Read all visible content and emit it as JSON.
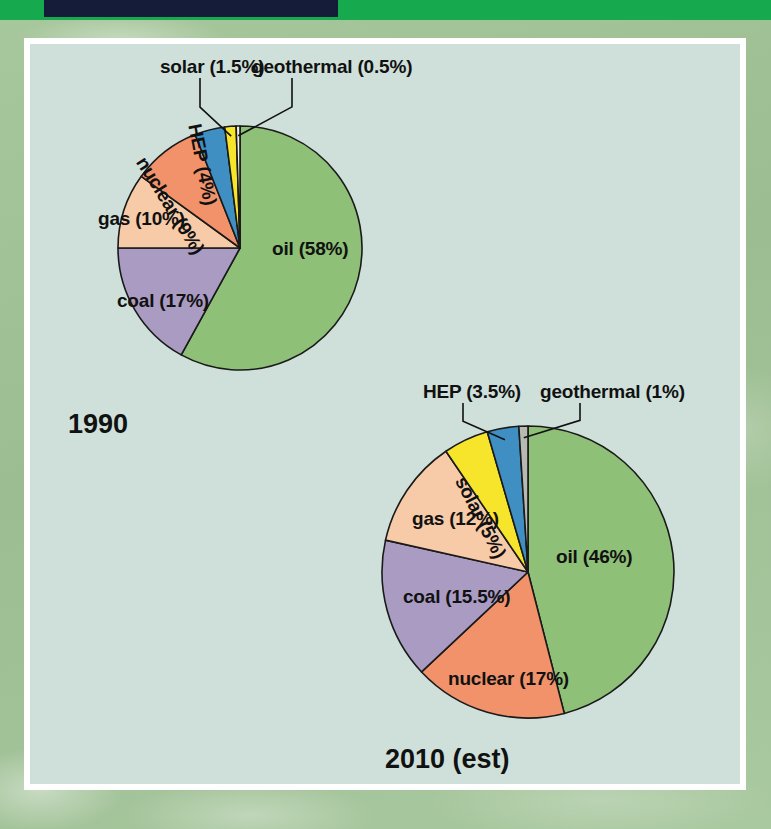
{
  "page": {
    "background_color": "#a2c398",
    "panel_color": "#cfe0da",
    "panel_border_color": "#ffffff",
    "header_bar_color": "#16a94e",
    "header_block_color": "#141c3a"
  },
  "chart_data": [
    {
      "type": "pie",
      "title": "1990",
      "total": 100,
      "start_angle_deg": 0,
      "direction": "clockwise",
      "center": {
        "x": 240,
        "y": 248
      },
      "radius": 122,
      "labels": [
        "oil",
        "coal",
        "gas",
        "nuclear",
        "HEP",
        "solar",
        "geothermal"
      ],
      "values": [
        58,
        17,
        10,
        9,
        4,
        1.5,
        0.5
      ],
      "slices": [
        {
          "label": "oil (58%)",
          "name": "oil",
          "value": 58,
          "color": "#8ec077",
          "label_style": "inside",
          "label_pos": {
            "x": 272,
            "y": 238
          }
        },
        {
          "label": "coal (17%)",
          "name": "coal",
          "value": 17,
          "color": "#a99bc2",
          "label_style": "inside",
          "label_pos": {
            "x": 117,
            "y": 290
          }
        },
        {
          "label": "gas (10%)",
          "name": "gas",
          "value": 10,
          "color": "#f7cba7",
          "label_style": "inside",
          "label_pos": {
            "x": 98,
            "y": 208
          }
        },
        {
          "label": "nuclear (9%)",
          "name": "nuclear",
          "value": 9,
          "color": "#f2926a",
          "label_style": "radial",
          "label_pos": {
            "x": 150,
            "y": 153
          },
          "rotation": 58
        },
        {
          "label": "HEP (4%)",
          "name": "HEP",
          "value": 4,
          "color": "#3f8fc3",
          "label_style": "radial",
          "label_pos": {
            "x": 205,
            "y": 122
          },
          "rotation": 79
        },
        {
          "label": "solar (1.5%)",
          "name": "solar",
          "value": 1.5,
          "color": "#f6e52b",
          "label_style": "leader",
          "label_pos": {
            "x": 160,
            "y": 56
          }
        },
        {
          "label": "geothermal (0.5%)",
          "name": "geothermal",
          "value": 0.5,
          "color": "#f2f2ee",
          "label_style": "leader",
          "label_pos": {
            "x": 252,
            "y": 56
          }
        }
      ],
      "legend": "none",
      "grid": false
    },
    {
      "type": "pie",
      "title": "2010 (est)",
      "total": 100,
      "start_angle_deg": 0,
      "direction": "clockwise",
      "center": {
        "x": 528,
        "y": 572
      },
      "radius": 146,
      "labels": [
        "oil",
        "nuclear",
        "coal",
        "gas",
        "solar",
        "HEP",
        "geothermal"
      ],
      "values": [
        46,
        17,
        15.5,
        12,
        5,
        3.5,
        1
      ],
      "slices": [
        {
          "label": "oil (46%)",
          "name": "oil",
          "value": 46,
          "color": "#8ec077",
          "label_style": "inside",
          "label_pos": {
            "x": 556,
            "y": 546
          }
        },
        {
          "label": "nuclear (17%)",
          "name": "nuclear",
          "value": 17,
          "color": "#f2926a",
          "label_style": "inside",
          "label_pos": {
            "x": 448,
            "y": 668
          }
        },
        {
          "label": "coal (15.5%)",
          "name": "coal",
          "value": 15.5,
          "color": "#a99bc2",
          "label_style": "inside",
          "label_pos": {
            "x": 403,
            "y": 586
          }
        },
        {
          "label": "gas (12%)",
          "name": "gas",
          "value": 12,
          "color": "#f7cba7",
          "label_style": "inside",
          "label_pos": {
            "x": 412,
            "y": 508
          }
        },
        {
          "label": "solar (5%)",
          "name": "solar",
          "value": 5,
          "color": "#f6e52b",
          "label_style": "radial",
          "label_pos": {
            "x": 470,
            "y": 473
          },
          "rotation": 63
        },
        {
          "label": "HEP (3.5%)",
          "name": "HEP",
          "value": 3.5,
          "color": "#3f8fc3",
          "label_style": "leader",
          "label_pos": {
            "x": 423,
            "y": 381
          }
        },
        {
          "label": "geothermal (1%)",
          "name": "geothermal",
          "value": 1,
          "color": "#b9b9b4",
          "label_style": "leader",
          "label_pos": {
            "x": 540,
            "y": 381
          }
        }
      ],
      "legend": "none",
      "grid": false
    }
  ]
}
